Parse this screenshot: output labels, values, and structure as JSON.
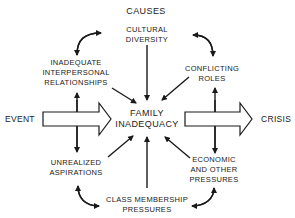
{
  "diagram": {
    "title": "CAUSES",
    "center": {
      "line1": "FAMILY",
      "line2": "INADEQUACY"
    },
    "input": "EVENT",
    "output": "CRISIS",
    "causes": [
      {
        "id": "cultural-diversity",
        "line1": "CULTURAL",
        "line2": "DIVERSITY"
      },
      {
        "id": "conflicting-roles",
        "line1": "CONFLICTING",
        "line2": "ROLES"
      },
      {
        "id": "economic-pressures",
        "line1": "ECONOMIC",
        "line2": "AND  OTHER",
        "line3": "PRESSURES"
      },
      {
        "id": "class-membership",
        "line1": "CLASS MEMBERSHIP",
        "line2": "PRESSURES"
      },
      {
        "id": "unrealized-aspirations",
        "line1": "UNREALIZED",
        "line2": "ASPIRATIONS"
      },
      {
        "id": "interpersonal-relationships",
        "line1": "INADEQUATE",
        "line2": "INTERPERSONAL",
        "line3": "RELATIONSHIPS"
      }
    ],
    "colors": {
      "ink": "#1a1a1a",
      "background": "#ffffff"
    }
  }
}
